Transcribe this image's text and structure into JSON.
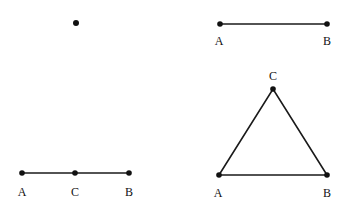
{
  "diagram": {
    "panels": [
      {
        "id": "point",
        "description": "single point",
        "points": [
          {
            "name": "",
            "x": 76,
            "y": 23
          }
        ],
        "labels": [],
        "segments": []
      },
      {
        "id": "segment-ab",
        "description": "line segment AB",
        "points": [
          {
            "name": "A",
            "x": 220,
            "y": 24
          },
          {
            "name": "B",
            "x": 327,
            "y": 24
          }
        ],
        "labels": [
          {
            "text": "A",
            "x": 219,
            "y": 45
          },
          {
            "text": "B",
            "x": 327,
            "y": 45
          }
        ],
        "segments": [
          [
            "A",
            "B"
          ]
        ]
      },
      {
        "id": "segment-acb",
        "description": "segment AB with midpoint C",
        "points": [
          {
            "name": "A",
            "x": 22,
            "y": 173
          },
          {
            "name": "C",
            "x": 75,
            "y": 173
          },
          {
            "name": "B",
            "x": 129,
            "y": 173
          }
        ],
        "labels": [
          {
            "text": "A",
            "x": 22,
            "y": 195
          },
          {
            "text": "C",
            "x": 75,
            "y": 195
          },
          {
            "text": "B",
            "x": 129,
            "y": 195
          }
        ],
        "segments": [
          [
            "A",
            "C"
          ],
          [
            "C",
            "B"
          ]
        ]
      },
      {
        "id": "triangle-abc",
        "description": "triangle ABC",
        "points": [
          {
            "name": "A",
            "x": 219,
            "y": 175
          },
          {
            "name": "B",
            "x": 327,
            "y": 175
          },
          {
            "name": "C",
            "x": 273,
            "y": 89
          }
        ],
        "labels": [
          {
            "text": "A",
            "x": 218,
            "y": 197
          },
          {
            "text": "B",
            "x": 327,
            "y": 197
          },
          {
            "text": "C",
            "x": 273,
            "y": 79
          }
        ],
        "segments": [
          [
            "A",
            "B"
          ],
          [
            "B",
            "C"
          ],
          [
            "C",
            "A"
          ]
        ]
      }
    ]
  },
  "labels": {
    "p2_a": "A",
    "p2_b": "B",
    "p3_a": "A",
    "p3_c": "C",
    "p3_b": "B",
    "p4_a": "A",
    "p4_b": "B",
    "p4_c": "C"
  }
}
